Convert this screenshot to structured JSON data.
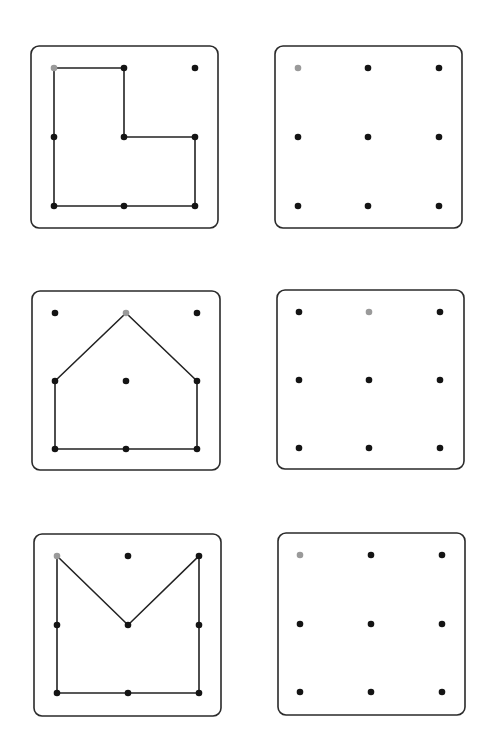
{
  "worksheet": {
    "colors": {
      "border": "#2a2a2a",
      "line": "#222222",
      "dot": "#141414",
      "start_dot": "#9a9a9a",
      "background": "#ffffff"
    },
    "grid_size": 3,
    "rows": [
      {
        "example": {
          "box": {
            "x": 31,
            "y": 46,
            "w": 187,
            "h": 182,
            "r": 8
          },
          "xs": [
            54,
            124,
            195
          ],
          "ys": [
            68,
            137,
            206
          ],
          "start_dot": [
            0,
            0
          ],
          "shape_name": "L-shape",
          "path_points": [
            [
              0,
              0
            ],
            [
              1,
              0
            ],
            [
              1,
              1
            ],
            [
              2,
              1
            ],
            [
              2,
              2
            ],
            [
              1,
              2
            ],
            [
              0,
              2
            ],
            [
              0,
              1
            ],
            [
              0,
              0
            ]
          ]
        },
        "practice": {
          "box": {
            "x": 275,
            "y": 46,
            "w": 187,
            "h": 182,
            "r": 8
          },
          "xs": [
            298,
            368,
            439
          ],
          "ys": [
            68,
            137,
            206
          ],
          "start_dot": [
            0,
            0
          ]
        }
      },
      {
        "example": {
          "box": {
            "x": 32,
            "y": 291,
            "w": 188,
            "h": 179,
            "r": 8
          },
          "xs": [
            55,
            126,
            197
          ],
          "ys": [
            313,
            381,
            449
          ],
          "start_dot": [
            1,
            0
          ],
          "shape_name": "house-shape",
          "path_points": [
            [
              1,
              0
            ],
            [
              2,
              1
            ],
            [
              2,
              2
            ],
            [
              1,
              2
            ],
            [
              0,
              2
            ],
            [
              0,
              1
            ],
            [
              1,
              0
            ]
          ]
        },
        "practice": {
          "box": {
            "x": 277,
            "y": 290,
            "w": 187,
            "h": 179,
            "r": 8
          },
          "xs": [
            299,
            369,
            440
          ],
          "ys": [
            312,
            380,
            448
          ],
          "start_dot": [
            1,
            0
          ]
        }
      },
      {
        "example": {
          "box": {
            "x": 34,
            "y": 534,
            "w": 187,
            "h": 182,
            "r": 8
          },
          "xs": [
            57,
            128,
            199
          ],
          "ys": [
            556,
            625,
            693
          ],
          "start_dot": [
            0,
            0
          ],
          "shape_name": "envelope-shape",
          "path_points": [
            [
              0,
              0
            ],
            [
              1,
              1
            ],
            [
              2,
              0
            ],
            [
              2,
              1
            ],
            [
              2,
              2
            ],
            [
              1,
              2
            ],
            [
              0,
              2
            ],
            [
              0,
              1
            ],
            [
              0,
              0
            ]
          ]
        },
        "practice": {
          "box": {
            "x": 278,
            "y": 533,
            "w": 187,
            "h": 182,
            "r": 8
          },
          "xs": [
            300,
            371,
            442
          ],
          "ys": [
            555,
            624,
            692
          ],
          "start_dot": [
            0,
            0
          ]
        }
      }
    ]
  }
}
